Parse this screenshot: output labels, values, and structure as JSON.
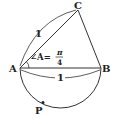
{
  "diagram": {
    "points": {
      "A": {
        "label": "A",
        "x": 20,
        "y": 68
      },
      "B": {
        "label": "B",
        "x": 101,
        "y": 68
      },
      "C": {
        "label": "C",
        "x": 78,
        "y": 10
      },
      "P": {
        "label": "P",
        "x": 43,
        "y": 103
      }
    },
    "segment_labels": {
      "AC": "1",
      "AB": "1"
    },
    "angle_label": {
      "prefix": "∠A=",
      "numerator": "π",
      "denominator": "4"
    },
    "colors": {
      "stroke": "#333333",
      "text": "#222222",
      "background": "#ffffff"
    }
  }
}
